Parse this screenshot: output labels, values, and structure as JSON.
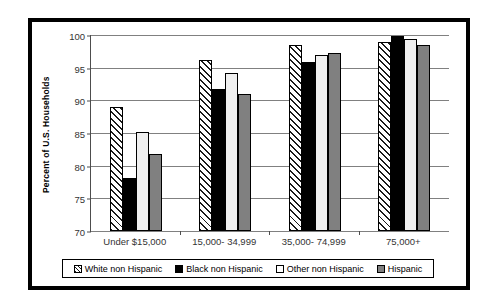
{
  "chart_data": {
    "type": "bar",
    "title": "",
    "xlabel": "",
    "ylabel": "Percent of U.S. Households",
    "ylim": [
      70,
      100
    ],
    "yticks": [
      70,
      75,
      80,
      85,
      90,
      95,
      100
    ],
    "grid": true,
    "legend_position": "bottom",
    "categories": [
      "Under $15,000",
      "15,000- 34,999",
      "35,000- 74,999",
      "75,000+"
    ],
    "series": [
      {
        "name": "White non Hispanic",
        "style": "diagonal-hatch",
        "color": "#ffffff",
        "values": [
          89.0,
          96.1,
          98.4,
          99.0
        ]
      },
      {
        "name": "Black non Hispanic",
        "style": "solid",
        "color": "#000000",
        "values": [
          78.1,
          91.8,
          95.8,
          99.9
        ]
      },
      {
        "name": "Other non Hispanic",
        "style": "solid",
        "color": "#f0f0f0",
        "values": [
          85.1,
          94.2,
          96.9,
          99.4
        ]
      },
      {
        "name": "Hispanic",
        "style": "solid",
        "color": "#808080",
        "values": [
          81.8,
          91.0,
          97.3,
          98.4
        ]
      }
    ]
  },
  "legend": {
    "items": [
      {
        "label": "White non Hispanic"
      },
      {
        "label": "Black non Hispanic"
      },
      {
        "label": "Other non Hispanic"
      },
      {
        "label": "Hispanic"
      }
    ]
  },
  "colors": {
    "frame": "#000000",
    "gridline": "#808080",
    "axis": "#4d4d4d",
    "text": "#333333",
    "background": "#ffffff"
  }
}
